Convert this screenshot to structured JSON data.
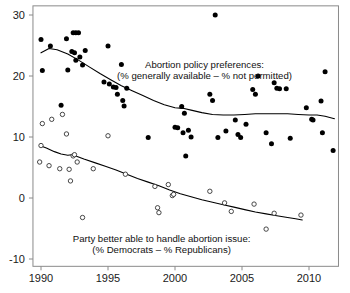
{
  "chart_data": {
    "type": "scatter",
    "title": "",
    "subtitle": "",
    "xlabel": "",
    "ylabel": "",
    "xlim": [
      1989.4,
      2012.2
    ],
    "ylim": [
      -11.2,
      31.5
    ],
    "grid": false,
    "legend_position": "inline-annotations",
    "xticks": [
      1990,
      1995,
      2000,
      2005,
      2010
    ],
    "xtick_labels": [
      "1990",
      "1995",
      "2000",
      "2005",
      "2010"
    ],
    "yticks": [
      -10,
      0,
      10,
      20,
      30
    ],
    "ytick_labels": [
      "-10",
      "0",
      "10",
      "20",
      "30"
    ],
    "annotations": [
      {
        "name": "abortion-policy-annotation",
        "lines": [
          "Abortion policy preferences:",
          "(% generally available – % not permitted)"
        ],
        "x": 2002.2,
        "y": 21.3
      },
      {
        "name": "party-handle-annotation",
        "lines": [
          "Party better able to handle abortion issue:",
          "(% Democrats – % Republicans)"
        ],
        "x": 1999.0,
        "y": -7.2
      }
    ],
    "series": [
      {
        "name": "Abortion policy preferences (% generally available – % not permitted)",
        "marker": "filled-circle",
        "color": "#000000",
        "points": [
          [
            1990.0,
            26.0
          ],
          [
            1990.1,
            20.9
          ],
          [
            1990.7,
            24.9
          ],
          [
            1991.5,
            15.2
          ],
          [
            1991.9,
            26.1
          ],
          [
            1992.0,
            21.0
          ],
          [
            1992.3,
            24.0
          ],
          [
            1992.4,
            27.1
          ],
          [
            1992.6,
            27.1
          ],
          [
            1992.8,
            27.1
          ],
          [
            1992.5,
            23.8
          ],
          [
            1992.6,
            22.6
          ],
          [
            1992.9,
            23.1
          ],
          [
            1993.1,
            21.8
          ],
          [
            1993.3,
            24.2
          ],
          [
            1994.7,
            19.0
          ],
          [
            1995.0,
            24.9
          ],
          [
            1995.1,
            18.7
          ],
          [
            1995.4,
            18.2
          ],
          [
            1995.6,
            18.1
          ],
          [
            1995.7,
            17.0
          ],
          [
            1996.0,
            21.9
          ],
          [
            1996.1,
            16.0
          ],
          [
            1996.2,
            15.1
          ],
          [
            1996.4,
            18.0
          ],
          [
            1998.0,
            9.9
          ],
          [
            2000.0,
            11.6
          ],
          [
            2000.2,
            11.5
          ],
          [
            2000.5,
            15.0
          ],
          [
            2000.6,
            10.7
          ],
          [
            2000.7,
            13.9
          ],
          [
            2000.8,
            6.9
          ],
          [
            2001.0,
            11.1
          ],
          [
            2001.2,
            10.0
          ],
          [
            2002.6,
            17.0
          ],
          [
            2002.8,
            16.0
          ],
          [
            2003.0,
            30.0
          ],
          [
            2003.2,
            9.9
          ],
          [
            2003.8,
            11.0
          ],
          [
            2004.5,
            12.8
          ],
          [
            2004.7,
            10.4
          ],
          [
            2004.9,
            9.9
          ],
          [
            2005.3,
            12.1
          ],
          [
            2005.8,
            17.8
          ],
          [
            2006.0,
            17.0
          ],
          [
            2006.2,
            20.0
          ],
          [
            2006.8,
            10.7
          ],
          [
            2007.2,
            8.9
          ],
          [
            2007.4,
            18.9
          ],
          [
            2007.6,
            18.0
          ],
          [
            2007.8,
            17.9
          ],
          [
            2008.3,
            17.9
          ],
          [
            2008.6,
            9.8
          ],
          [
            2009.8,
            14.8
          ],
          [
            2010.2,
            12.9
          ],
          [
            2010.3,
            12.8
          ],
          [
            2010.9,
            15.9
          ],
          [
            2011.0,
            10.7
          ],
          [
            2011.2,
            20.7
          ],
          [
            2011.8,
            7.8
          ]
        ]
      },
      {
        "name": "Party better able to handle abortion issue (% Democrats – % Republicans)",
        "marker": "open-circle",
        "color": "#000000",
        "points": [
          [
            1989.9,
            5.9
          ],
          [
            1990.0,
            8.6
          ],
          [
            1990.1,
            12.2
          ],
          [
            1990.6,
            5.3
          ],
          [
            1990.8,
            12.9
          ],
          [
            1991.4,
            4.8
          ],
          [
            1991.6,
            13.7
          ],
          [
            1991.9,
            10.5
          ],
          [
            1992.1,
            4.7
          ],
          [
            1992.2,
            2.8
          ],
          [
            1992.4,
            6.9
          ],
          [
            1992.5,
            7.1
          ],
          [
            1992.7,
            5.9
          ],
          [
            1993.1,
            -3.2
          ],
          [
            1993.9,
            4.8
          ],
          [
            1995.0,
            10.2
          ],
          [
            1996.3,
            3.9
          ],
          [
            1998.5,
            1.9
          ],
          [
            1998.7,
            -1.6
          ],
          [
            1998.8,
            -2.4
          ],
          [
            1999.5,
            2.2
          ],
          [
            1999.8,
            0.4
          ],
          [
            1999.9,
            0.6
          ],
          [
            2002.6,
            1.1
          ],
          [
            2003.7,
            -0.8
          ],
          [
            2004.2,
            -2.2
          ],
          [
            2005.9,
            -1.0
          ],
          [
            2006.8,
            -5.1
          ],
          [
            2007.4,
            -2.5
          ],
          [
            2009.4,
            -2.8
          ]
        ]
      }
    ],
    "trend_lines": [
      {
        "name": "abortion-policy-loess",
        "for_series": "Abortion policy preferences (% generally available – % not permitted)",
        "points": [
          [
            1990.0,
            23.8
          ],
          [
            1990.6,
            24.5
          ],
          [
            1991.2,
            24.3
          ],
          [
            1992.0,
            23.6
          ],
          [
            1992.8,
            22.6
          ],
          [
            1993.6,
            21.5
          ],
          [
            1994.4,
            20.4
          ],
          [
            1995.2,
            19.4
          ],
          [
            1996.0,
            18.4
          ],
          [
            1996.8,
            17.6
          ],
          [
            1997.6,
            16.8
          ],
          [
            1998.4,
            16.0
          ],
          [
            1999.2,
            15.3
          ],
          [
            2000.0,
            14.8
          ],
          [
            2000.6,
            14.7
          ],
          [
            2001.2,
            14.4
          ],
          [
            2002.0,
            14.0
          ],
          [
            2002.8,
            13.7
          ],
          [
            2003.6,
            13.6
          ],
          [
            2004.4,
            13.6
          ],
          [
            2005.2,
            13.7
          ],
          [
            2006.0,
            13.8
          ],
          [
            2006.8,
            13.8
          ],
          [
            2007.6,
            13.8
          ],
          [
            2008.4,
            13.8
          ],
          [
            2009.2,
            13.7
          ],
          [
            2010.0,
            13.6
          ],
          [
            2010.6,
            13.6
          ],
          [
            2011.2,
            13.4
          ],
          [
            2011.9,
            13.0
          ]
        ]
      },
      {
        "name": "party-handle-loess",
        "for_series": "Party better able to handle abortion issue (% Democrats – % Republicans)",
        "points": [
          [
            1989.9,
            8.6
          ],
          [
            1990.4,
            8.2
          ],
          [
            1991.0,
            7.6
          ],
          [
            1991.5,
            7.2
          ],
          [
            1992.0,
            7.0
          ],
          [
            1992.3,
            7.1
          ],
          [
            1992.6,
            6.9
          ],
          [
            1993.2,
            6.4
          ],
          [
            1994.0,
            5.8
          ],
          [
            1994.8,
            5.2
          ],
          [
            1995.6,
            4.6
          ],
          [
            1996.4,
            3.9
          ],
          [
            1997.2,
            3.2
          ],
          [
            1998.0,
            2.6
          ],
          [
            1998.8,
            2.0
          ],
          [
            1999.6,
            1.3
          ],
          [
            2000.4,
            0.7
          ],
          [
            2001.2,
            0.2
          ],
          [
            2002.0,
            -0.3
          ],
          [
            2002.8,
            -0.7
          ],
          [
            2003.6,
            -1.1
          ],
          [
            2004.4,
            -1.5
          ],
          [
            2005.2,
            -1.9
          ],
          [
            2006.0,
            -2.3
          ],
          [
            2006.8,
            -2.6
          ],
          [
            2007.6,
            -2.9
          ],
          [
            2008.4,
            -3.2
          ],
          [
            2009.0,
            -3.4
          ],
          [
            2009.5,
            -3.6
          ]
        ]
      }
    ]
  },
  "axis": {
    "x_tick_labels": [
      "1990",
      "1995",
      "2000",
      "2005",
      "2010"
    ],
    "y_tick_labels": [
      "30",
      "20",
      "10",
      "0",
      "-10"
    ]
  },
  "colors": {
    "frame": "#8a8a8a",
    "marker_filled": "#000000",
    "marker_open_stroke": "#333333",
    "trend": "#000000",
    "text": "#111111",
    "background": "#ffffff"
  }
}
